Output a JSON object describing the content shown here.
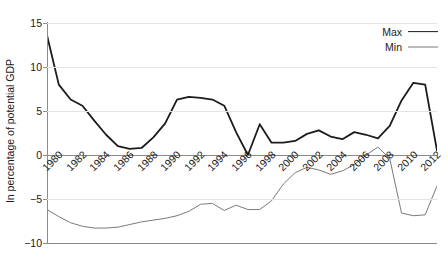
{
  "chart_data": {
    "type": "line",
    "title": "",
    "xlabel": "",
    "ylabel": "In percentage of potential GDP",
    "ylim": [
      -10,
      15
    ],
    "yticks": [
      15,
      10,
      5,
      0,
      -5,
      -10
    ],
    "ytick_labels": [
      "15",
      "10",
      "5",
      "0",
      "−5",
      "−10"
    ],
    "grid": true,
    "legend_position": "top-right",
    "x": [
      1980,
      1981,
      1982,
      1983,
      1984,
      1985,
      1986,
      1987,
      1988,
      1989,
      1990,
      1991,
      1992,
      1993,
      1994,
      1995,
      1996,
      1997,
      1998,
      1999,
      2000,
      2001,
      2002,
      2003,
      2004,
      2005,
      2006,
      2007,
      2008,
      2009,
      2010,
      2011,
      2012,
      2013
    ],
    "xtick_labels": [
      "1980",
      "1982",
      "1984",
      "1986",
      "1988",
      "1990",
      "1992",
      "1994",
      "1996",
      "1998",
      "2000",
      "2002",
      "2004",
      "2006",
      "2008",
      "2010",
      "2012"
    ],
    "series": [
      {
        "name": "Max",
        "color": "#1c1c1c",
        "width": 1.8,
        "values": [
          13.6,
          8.0,
          6.3,
          5.6,
          3.9,
          2.3,
          1.0,
          0.7,
          0.8,
          2.0,
          3.6,
          6.3,
          6.6,
          6.5,
          6.3,
          5.6,
          2.6,
          0.0,
          3.5,
          1.4,
          1.4,
          1.6,
          2.4,
          2.8,
          2.1,
          1.8,
          2.6,
          2.3,
          1.9,
          3.3,
          6.2,
          8.2,
          8.0,
          0.5
        ]
      },
      {
        "name": "Min",
        "color": "#7a7a7a",
        "width": 1.0,
        "values": [
          -6.2,
          -7.0,
          -7.7,
          -8.1,
          -8.3,
          -8.3,
          -8.2,
          -7.9,
          -7.6,
          -7.4,
          -7.2,
          -6.9,
          -6.4,
          -5.6,
          -5.5,
          -6.3,
          -5.7,
          -6.2,
          -6.2,
          -5.2,
          -3.3,
          -2.0,
          -1.4,
          -1.7,
          -2.2,
          -1.8,
          -1.1,
          0.0,
          0.9,
          -0.4,
          -6.6,
          -6.9,
          -6.8,
          -3.5
        ]
      }
    ],
    "series_draw_order": [
      "Max",
      "Min"
    ],
    "notes": {
      "max_last_point_value": 0.4,
      "min_last_point_value": -6.6
    }
  },
  "legend": {
    "entries": [
      {
        "label": "Max",
        "style": "thick-dark-line"
      },
      {
        "label": "Min",
        "style": "thin-gray-line"
      }
    ]
  },
  "axes": {
    "y_axis_title": "In percentage of potential GDP",
    "y_tick_labels": [
      "15",
      "10",
      "5",
      "0",
      "−5",
      "−10"
    ],
    "x_tick_labels": [
      "1980",
      "1982",
      "1984",
      "1986",
      "1988",
      "1990",
      "1992",
      "1994",
      "1996",
      "1998",
      "2000",
      "2002",
      "2004",
      "2006",
      "2008",
      "2010",
      "2012"
    ]
  },
  "colors": {
    "max_line": "#1c1c1c",
    "min_line": "#7a7a7a",
    "gridline": "#e4e4e4",
    "axis": "#8b8b8b",
    "text": "#1a1a1a",
    "background": "#ffffff"
  }
}
